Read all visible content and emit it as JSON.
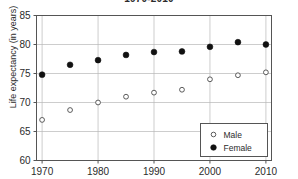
{
  "chart_data": {
    "type": "scatter",
    "title": "1970-2010",
    "xlabel": "",
    "ylabel": "Life expectancy (in years)",
    "x": [
      1970,
      1975,
      1980,
      1985,
      1990,
      1995,
      2000,
      2005,
      2010
    ],
    "xlim": [
      1969,
      2011
    ],
    "ylim": [
      60,
      85
    ],
    "xticks": [
      "1970",
      "1980",
      "1990",
      "2000",
      "2010"
    ],
    "xtick_values": [
      1970,
      1980,
      1990,
      2000,
      2010
    ],
    "yticks": [
      "60",
      "65",
      "70",
      "75",
      "80",
      "85"
    ],
    "ytick_values": [
      60,
      65,
      70,
      75,
      80,
      85
    ],
    "grid": true,
    "legend_position": "bottom-right",
    "series": [
      {
        "name": "Male",
        "marker": "open-circle",
        "color": "#ffffff",
        "edge_color": "#4a4a4a",
        "values": [
          67.0,
          68.7,
          70.0,
          71.0,
          71.7,
          72.2,
          74.0,
          74.7,
          75.2
        ]
      },
      {
        "name": "Female",
        "marker": "filled-circle",
        "color": "#111111",
        "edge_color": "#111111",
        "values": [
          74.8,
          76.5,
          77.3,
          78.2,
          78.7,
          78.8,
          79.6,
          80.4,
          80.0
        ]
      }
    ]
  },
  "legend": {
    "items": [
      {
        "label": "Male",
        "marker": "open-circle"
      },
      {
        "label": "Female",
        "marker": "filled-circle"
      }
    ]
  }
}
